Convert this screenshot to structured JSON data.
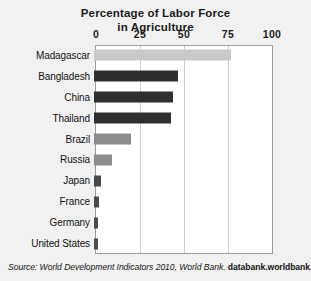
{
  "title": {
    "line1": "Percentage of Labor Force",
    "line2": "in Agriculture"
  },
  "source": {
    "prefix": "Source: World Development Indicators 2010, World Bank. ",
    "link": "databank.worldbank.org"
  },
  "chart_data": {
    "type": "bar",
    "orientation": "horizontal",
    "title": "Percentage of Labor Force in Agriculture",
    "xlabel": "",
    "ylabel": "",
    "xlim": [
      0,
      100
    ],
    "ticks": [
      0,
      25,
      50,
      75,
      100
    ],
    "tick_labels": [
      "0",
      "25",
      "50",
      "75",
      "100"
    ],
    "grid": true,
    "legend": false,
    "categories": [
      "Madagascar",
      "Bangladesh",
      "China",
      "Thailand",
      "Brazil",
      "Russia",
      "Japan",
      "France",
      "Germany",
      "United States"
    ],
    "values": [
      78,
      48,
      45,
      44,
      21,
      10,
      4,
      3,
      2,
      2
    ],
    "bar_colors": [
      "#c9c9c9",
      "#2f2f2f",
      "#2f2f2f",
      "#2f2f2f",
      "#8c8c8c",
      "#8c8c8c",
      "#4a4a4a",
      "#4a4a4a",
      "#4a4a4a",
      "#4a4a4a"
    ]
  }
}
